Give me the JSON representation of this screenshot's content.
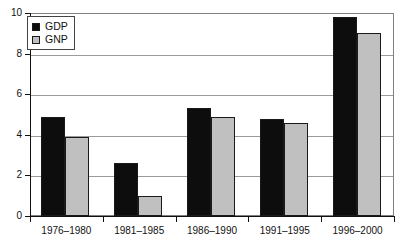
{
  "chart_data": {
    "type": "bar",
    "title": "",
    "subtitle": "",
    "xlabel": "",
    "ylabel": "",
    "categories": [
      "1976–1980",
      "1981–1985",
      "1986–1990",
      "1991–1995",
      "1996–2000"
    ],
    "series": [
      {
        "name": "GDP",
        "color": "#0d0d0d",
        "values": [
          4.9,
          2.6,
          5.3,
          4.8,
          9.8
        ]
      },
      {
        "name": "GNP",
        "color": "#c0c0c0",
        "values": [
          3.9,
          1.0,
          4.9,
          4.6,
          9.0
        ]
      }
    ],
    "ylim": [
      0,
      10
    ],
    "ytick_values": [
      0,
      2,
      4,
      6,
      8,
      10
    ],
    "ytick_labels": [
      "0",
      "2",
      "4",
      "6",
      "8",
      "10"
    ],
    "grid": true,
    "grid_axis": "y",
    "legend": {
      "position": "top-left-inside",
      "entries": [
        {
          "label": "GDP",
          "swatch": "black-square"
        },
        {
          "label": "GNP",
          "swatch": "gray-square"
        }
      ]
    },
    "annotations": []
  }
}
